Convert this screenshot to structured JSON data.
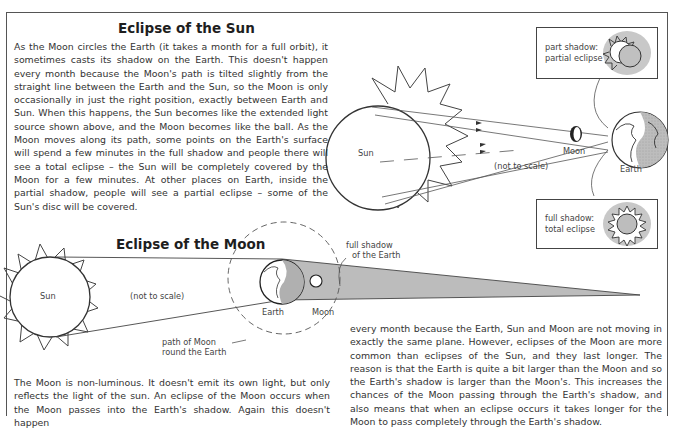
{
  "solar": {
    "title": "Eclipse of the Sun",
    "text": "As the Moon circles the Earth (it takes a month for a full orbit), it sometimes casts its shadow on the Earth. This doesn't happen every month because the Moon's path is tilted slightly from the straight line between the Earth and the Sun, so the Moon is only occasionally in just the right position, exactly between Earth and Sun. When this happens, the Sun becomes like the extended light source shown above, and the Moon becomes like the ball. As the Moon moves along its path, some points on the Earth's surface will spend a few minutes in the full shadow and people there will see a total eclipse – the Sun will be completely covered by the Moon for a few minutes. At other places on Earth, inside the partial shadow, people will see a partial eclipse – some of the Sun's disc will be covered.",
    "diagram": {
      "sun_label": "Sun",
      "moon_label": "Moon",
      "earth_label": "Earth",
      "scale_note": "(not to scale)",
      "inset_partial": {
        "line1": "part shadow:",
        "line2": "partial eclipse"
      },
      "inset_total": {
        "line1": "full shadow:",
        "line2": "total eclipse"
      }
    }
  },
  "lunar": {
    "title": "Eclipse of the Moon",
    "diagram": {
      "sun_label": "Sun",
      "scale_note": "(not to scale)",
      "earth_label": "Earth",
      "moon_label": "Moon",
      "shadow_label_1": "full shadow",
      "shadow_label_2": "of the Earth",
      "path_label_1": "path of Moon",
      "path_label_2": "round the Earth"
    },
    "text_left": "The Moon is non-luminous. It doesn't emit its own light, but only reflects the light of the sun. An eclipse of the Moon occurs when the Moon passes into the Earth's shadow. Again this doesn't happen",
    "text_right": "every month because the Earth, Sun and Moon are not moving in exactly the same plane. However, eclipses of the Moon are more common than eclipses of the Sun, and they last longer. The reason is that the Earth is quite a bit larger than the Moon and so the Earth's shadow is larger than the Moon's. This increases the chances of the Moon passing through the Earth's shadow, and also means that when an eclipse occurs it takes longer for the Moon to pass completely through the Earth's shadow."
  },
  "colors": {
    "shadow": "#b9b9b9",
    "halo": "#c8c8c8",
    "ink": "#333333"
  }
}
